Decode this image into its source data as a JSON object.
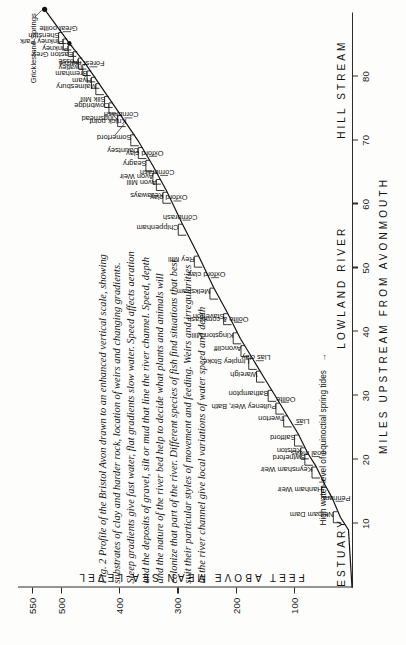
{
  "figure": {
    "caption_lines": [
      "Fig. 2 Profile of the Bristol Avon drawn to an enhanced vertical scale, showing",
      "substrates of clay and harder rock, location of weirs and changing gradients.",
      "Steep gradients give fast water, flat gradients slow water. Speed affects aeration",
      "and the deposits of gravel, silt or mud that line the river channel. Speed, depth",
      "and the nature of the river bed help to decide what plants and animals will",
      "colonize that part of the river. Different species of fish find situations that best",
      "suit their particular styles of movement and feeding. Weirs and irregularities",
      "in the river channel give local variations of water speed and depth"
    ],
    "tide_note": "High water-level of equinoctial spring tides",
    "tide_arrow": "→"
  },
  "chart_data": {
    "type": "line",
    "title": "Profile of the Bristol Avon",
    "xlabel": "MILES UPSTREAM FROM AVONMOUTH",
    "ylabel": "FEET ABOVE MEAN SEA-LEVEL",
    "xlim": [
      0,
      90
    ],
    "ylim": [
      0,
      560
    ],
    "grid": false,
    "xticks": [
      10,
      20,
      30,
      40,
      50,
      60,
      70,
      80
    ],
    "yticks": [
      100,
      200,
      300,
      400,
      500,
      550
    ],
    "zones": [
      {
        "label": "ESTUARY",
        "center_miles": 5.5
      },
      {
        "label": "LOWLAND RIVER",
        "center_miles": 47
      },
      {
        "label": "HILL STREAM",
        "center_miles": 78
      }
    ],
    "profile": [
      {
        "x": 0,
        "y": 0
      },
      {
        "x": 9,
        "y": 6
      },
      {
        "x": 11,
        "y": 20
      },
      {
        "x": 14,
        "y": 34
      },
      {
        "x": 16,
        "y": 46
      },
      {
        "x": 19,
        "y": 62
      },
      {
        "x": 21,
        "y": 76
      },
      {
        "x": 24,
        "y": 92
      },
      {
        "x": 27,
        "y": 112
      },
      {
        "x": 30,
        "y": 132
      },
      {
        "x": 33,
        "y": 152
      },
      {
        "x": 36,
        "y": 172
      },
      {
        "x": 39,
        "y": 192
      },
      {
        "x": 43,
        "y": 214
      },
      {
        "x": 47,
        "y": 238
      },
      {
        "x": 52,
        "y": 264
      },
      {
        "x": 57,
        "y": 292
      },
      {
        "x": 62,
        "y": 318
      },
      {
        "x": 66,
        "y": 342
      },
      {
        "x": 70,
        "y": 368
      },
      {
        "x": 74,
        "y": 398
      },
      {
        "x": 78,
        "y": 428
      },
      {
        "x": 82,
        "y": 458
      },
      {
        "x": 85,
        "y": 484
      },
      {
        "x": 88,
        "y": 508
      },
      {
        "x": 90.5,
        "y": 528
      }
    ],
    "source_point": {
      "x": 90.5,
      "y": 528,
      "label": "Gricklestone Springs"
    },
    "weirs": [
      {
        "name": "Netham Dam",
        "x": 11
      },
      {
        "name": "Hanham Weir",
        "x": 15
      },
      {
        "name": "Keynsham Weir",
        "x": 18
      },
      {
        "name": "Swineford",
        "x": 20
      },
      {
        "name": "Kelston",
        "x": 21
      },
      {
        "name": "Saltford",
        "x": 23
      },
      {
        "name": "Twerton",
        "x": 26
      },
      {
        "name": "Pulteney Weir, Bath",
        "x": 28
      },
      {
        "name": "Bathampton",
        "x": 30
      },
      {
        "name": "Wareigh",
        "x": 33
      },
      {
        "name": "Limpley Stoke",
        "x": 35
      },
      {
        "name": "Avoncliff",
        "x": 37
      },
      {
        "name": "Kingston Mill",
        "x": 39
      },
      {
        "name": "Staverton",
        "x": 42
      },
      {
        "name": "Melksham",
        "x": 46
      },
      {
        "name": "Rey Mill",
        "x": 51
      },
      {
        "name": "Chippenham",
        "x": 56
      },
      {
        "name": "Kellaways",
        "x": 61
      },
      {
        "name": "Avon Mill",
        "x": 63
      },
      {
        "name": "Avon Weir",
        "x": 64
      },
      {
        "name": "Seagry",
        "x": 66
      },
      {
        "name": "Dauntsey",
        "x": 68
      },
      {
        "name": "Somerford",
        "x": 70
      },
      {
        "name": "Kingsmead",
        "x": 73
      },
      {
        "name": "Cowbridge",
        "x": 75
      },
      {
        "name": "Silk Mill",
        "x": 76
      },
      {
        "name": "Malmesbury",
        "x": 78
      },
      {
        "name": "Hyam",
        "x": 79
      },
      {
        "name": "Bremham",
        "x": 80
      },
      {
        "name": "Twatley",
        "x": 81
      },
      {
        "name": "Fosse",
        "x": 82
      },
      {
        "name": "Easton Grey",
        "x": 83
      },
      {
        "name": "Pinkney",
        "x": 84
      },
      {
        "name": "Pinkney Park",
        "x": 85
      },
      {
        "name": "Shenston",
        "x": 86
      }
    ],
    "geology": [
      {
        "name": "Pennant",
        "x": 13.5
      },
      {
        "name": "Coal meas.",
        "x": 20.5
      },
      {
        "name": "Lias",
        "x": 25.5
      },
      {
        "name": "Oolite",
        "x": 29
      },
      {
        "name": "Lias clay",
        "x": 35.5
      },
      {
        "name": "Oolite & cornbrash",
        "x": 41.5
      },
      {
        "name": "Oxford clay",
        "x": 48.5
      },
      {
        "name": "Cornbrash",
        "x": 57.5
      },
      {
        "name": "Oxford clay",
        "x": 60.5
      },
      {
        "name": "Cornbrash",
        "x": 64.5
      },
      {
        "name": "Oxford clay",
        "x": 67.5
      },
      {
        "name": "Cornbrash",
        "x": 73.5
      },
      {
        "name": "Forest marble",
        "x": 81.5
      },
      {
        "name": "Great oolite",
        "x": 87
      }
    ],
    "annotations": [
      {
        "text": "Knick point",
        "x": 70.5,
        "y": 388
      }
    ]
  }
}
